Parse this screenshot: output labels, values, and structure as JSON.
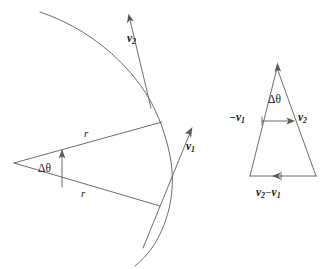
{
  "figure": {
    "background_color": "#ffffff",
    "line_color": "#5a5a5a",
    "text_color": "#1a1a1a",
    "width": 328,
    "height": 269
  },
  "left_diagram": {
    "name": "circular-arc-sector",
    "description": "Circular arc with two radii from a center vertex forming angle delta-theta, and two tangential velocity vectors",
    "labels": {
      "radius_upper": "r",
      "radius_lower": "r",
      "angle": "Δθ",
      "velocity_1_symbol": "v",
      "velocity_1_sub": "1",
      "velocity_2_symbol": "v",
      "velocity_2_sub": "2"
    },
    "elements": [
      "arc",
      "upper-radius",
      "lower-radius",
      "angle-arrow",
      "velocity-1-arrow",
      "velocity-2-arrow"
    ]
  },
  "right_diagram": {
    "name": "vector-subtraction-triangle",
    "description": "Isosceles triangle showing minus v1 and v2 at the top with angle delta-theta at apex and resultant v2 minus v1 along the base",
    "labels": {
      "angle": "Δθ",
      "minus_v1_prefix": "−v",
      "minus_v1_sub": "1",
      "v2_symbol": "v",
      "v2_sub": "2",
      "resultant_first": "v",
      "resultant_first_sub": "2",
      "resultant_operator": "−",
      "resultant_second": "v",
      "resultant_second_sub": "1"
    },
    "elements": [
      "triangle-left-side",
      "triangle-right-side",
      "triangle-base",
      "apex-arrowhead",
      "horizontal-connector-arrow",
      "base-resultant-arrow"
    ]
  }
}
